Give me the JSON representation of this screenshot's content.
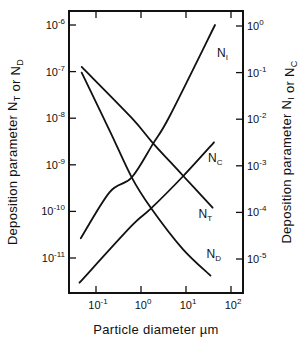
{
  "chart_data": {
    "type": "line",
    "title": "",
    "xlabel": "Particle diameter  µm",
    "ylabel_left": "Deposition  parameter  N_T or N_D",
    "ylabel_right": "Deposition  parameter  N_I or N_C",
    "x_scale": "log",
    "y_scale": "log",
    "xlim": [
      0.03,
      120
    ],
    "ylim_left": [
      1.8e-12,
      2e-06
    ],
    "ylim_right": [
      1.8e-06,
      2.0
    ],
    "grid": false,
    "legend": "none (curves labeled inline at right ends)",
    "x_ticks": [
      {
        "value": 0.1,
        "base": "10",
        "exp": "-1"
      },
      {
        "value": 1,
        "base": "10",
        "exp": "0"
      },
      {
        "value": 10,
        "base": "10",
        "exp": "1"
      },
      {
        "value": 100,
        "base": "10",
        "exp": "2"
      }
    ],
    "y_ticks_left": [
      {
        "value": 1e-06,
        "base": "10",
        "exp": "-6"
      },
      {
        "value": 1e-07,
        "base": "10",
        "exp": "-7"
      },
      {
        "value": 1e-08,
        "base": "10",
        "exp": "-8"
      },
      {
        "value": 1e-09,
        "base": "10",
        "exp": "-9"
      },
      {
        "value": 1e-10,
        "base": "10",
        "exp": "-10"
      },
      {
        "value": 1e-11,
        "base": "10",
        "exp": "-11"
      }
    ],
    "y_ticks_right": [
      {
        "value": 1,
        "base": "10",
        "exp": "0"
      },
      {
        "value": 0.1,
        "base": "10",
        "exp": "-1"
      },
      {
        "value": 0.01,
        "base": "10",
        "exp": "-2"
      },
      {
        "value": 0.001,
        "base": "10",
        "exp": "-3"
      },
      {
        "value": 0.0001,
        "base": "10",
        "exp": "-4"
      },
      {
        "value": 1e-05,
        "base": "10",
        "exp": "-5"
      }
    ],
    "series": [
      {
        "name": "N_I",
        "label_main": "N",
        "label_sub": "I",
        "axis": "right",
        "x": [
          0.046,
          0.2,
          0.62,
          1.86,
          4.4,
          44
        ],
        "y": [
          2.8e-05,
          0.00027,
          0.00056,
          0.003,
          0.012,
          1.05
        ]
      },
      {
        "name": "N_C",
        "label_main": "N",
        "label_sub": "C",
        "axis": "right",
        "x": [
          0.043,
          0.6,
          1.65,
          8.5,
          42
        ],
        "y": [
          3.1e-06,
          5e-05,
          0.00012,
          0.00059,
          0.0032
        ]
      },
      {
        "name": "N_T",
        "label_main": "N",
        "label_sub": "T",
        "axis": "left",
        "x": [
          0.048,
          0.6,
          1.86,
          8.5,
          39
        ],
        "y": [
          1.26e-07,
          1.05e-08,
          2.9e-09,
          5.9e-10,
          1.2e-10
        ]
      },
      {
        "name": "N_D",
        "label_main": "N",
        "label_sub": "D",
        "axis": "left",
        "x": [
          0.048,
          0.2,
          0.62,
          1.65,
          8.5,
          35
        ],
        "y": [
          9.5e-08,
          5.5e-09,
          5.4e-10,
          1.2e-10,
          1.55e-11,
          4.2e-12
        ]
      }
    ]
  }
}
